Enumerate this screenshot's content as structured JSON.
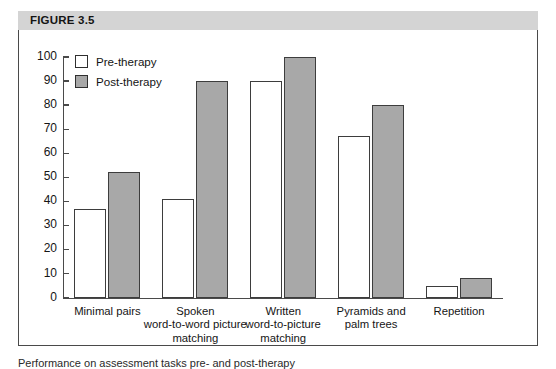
{
  "figure": {
    "header_label": "FIGURE 3.5",
    "caption": "Performance on assessment tasks pre- and post-therapy"
  },
  "legend": {
    "position": "top-left-inside",
    "entries": [
      {
        "label": "Pre-therapy",
        "swatch": "white-square-icon",
        "color": "#ffffff"
      },
      {
        "label": "Post-therapy",
        "swatch": "gray-square-icon",
        "color": "#a8a8a8"
      }
    ]
  },
  "axis": {
    "y_ticks": [
      "100",
      "90",
      "80",
      "70",
      "60",
      "50",
      "40",
      "30",
      "20",
      "10",
      "0"
    ]
  },
  "chart_data": {
    "type": "bar",
    "title": "FIGURE 3.5",
    "xlabel": "",
    "ylabel": "",
    "ylim": [
      0,
      100
    ],
    "ytick_step": 10,
    "grid": false,
    "legend_position": "upper left",
    "categories": [
      "Minimal pairs",
      "Spoken word-to-word picture matching",
      "Written word-to-picture matching",
      "Pyramids and palm trees",
      "Repetition"
    ],
    "category_lines": [
      [
        "Minimal pairs"
      ],
      [
        "Spoken",
        "word-to-word picture",
        "matching"
      ],
      [
        "Written",
        "word-to-picture",
        "matching"
      ],
      [
        "Pyramids and",
        "palm trees"
      ],
      [
        "Repetition"
      ]
    ],
    "series": [
      {
        "name": "Pre-therapy",
        "color": "#ffffff",
        "values": [
          37,
          41,
          90,
          67,
          5
        ]
      },
      {
        "name": "Post-therapy",
        "color": "#a8a8a8",
        "values": [
          52,
          90,
          100,
          80,
          8
        ]
      }
    ]
  }
}
